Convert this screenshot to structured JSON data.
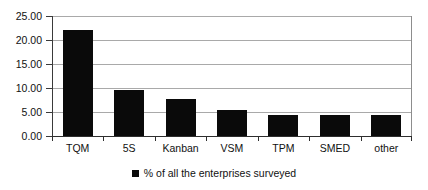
{
  "chart_data": {
    "type": "bar",
    "title": "",
    "subtitle": "",
    "xlabel": "",
    "ylabel": "",
    "categories": [
      "TQM",
      "5S",
      "Kanban",
      "VSM",
      "TPM",
      "SMED",
      "other"
    ],
    "values": [
      22.0,
      9.5,
      7.8,
      5.4,
      4.4,
      4.4,
      4.4
    ],
    "series": [
      {
        "name": "% of all the enterprises surveyed",
        "values": [
          22.0,
          9.5,
          7.8,
          5.4,
          4.4,
          4.4,
          4.4
        ],
        "color": "#0a0a0a"
      }
    ],
    "ylim": [
      0,
      25
    ],
    "ytick_step": 5,
    "ytick_labels": [
      "0.00",
      "5.00",
      "10.00",
      "15.00",
      "20.00",
      "25.00"
    ],
    "ytick_values": [
      0,
      5,
      10,
      15,
      20,
      25
    ],
    "grid": true,
    "grid_axis": "y",
    "legend": {
      "position": "bottom-center",
      "entries": [
        {
          "label": "% of all the enterprises surveyed",
          "marker": "square",
          "color": "#0a0a0a"
        }
      ]
    },
    "colors": {
      "bar": "#0a0a0a",
      "gridline": "#a9a9a9",
      "axis": "#2e2e2e",
      "text": "#111111",
      "background": "#ffffff"
    }
  }
}
